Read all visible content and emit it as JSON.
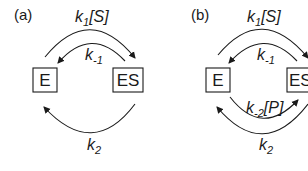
{
  "panels": [
    {
      "label": "(a)",
      "nodes": {
        "left": "E",
        "right": "ES"
      },
      "rates": {
        "forward_top": {
          "base": "k",
          "sub": "1",
          "tail": "[S]"
        },
        "reverse_top": {
          "base": "k",
          "sub": "-1",
          "tail": ""
        },
        "forward_bottom": {
          "base": "k",
          "sub": "2",
          "tail": ""
        }
      }
    },
    {
      "label": "(b)",
      "nodes": {
        "left": "E",
        "right": "ES"
      },
      "rates": {
        "forward_top": {
          "base": "k",
          "sub": "1",
          "tail": "[S]"
        },
        "reverse_top": {
          "base": "k",
          "sub": "-1",
          "tail": ""
        },
        "reverse_bottom": {
          "base": "k",
          "sub": "-2",
          "tail": "[P]"
        },
        "forward_bottom": {
          "base": "k",
          "sub": "2",
          "tail": ""
        }
      }
    }
  ],
  "colors": {
    "ink": "#1a1a1a",
    "background": "#ffffff"
  }
}
